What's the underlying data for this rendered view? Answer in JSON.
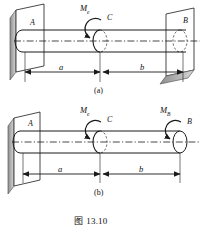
{
  "figure": {
    "caption": "图 13.10",
    "caption_prefix": "图",
    "caption_number": "13.10"
  },
  "panels": [
    {
      "id": "a",
      "sub_caption": "(a)",
      "support_left": "fixed-wall",
      "support_right": "fixed-wall",
      "points": [
        {
          "name": "point-label-a",
          "text": "A"
        },
        {
          "name": "point-label-c",
          "text": "C"
        },
        {
          "name": "point-label-b",
          "text": "B"
        }
      ],
      "moments": [
        {
          "name": "moment-me",
          "symbol": "M",
          "subscript": "e",
          "at": "C"
        }
      ],
      "dimensions": [
        {
          "name": "dimension-a",
          "text": "a",
          "from": "A",
          "to": "C"
        },
        {
          "name": "dimension-b",
          "text": "b",
          "from": "C",
          "to": "B"
        }
      ]
    },
    {
      "id": "b",
      "sub_caption": "(b)",
      "support_left": "fixed-wall",
      "support_right": "free-end",
      "points": [
        {
          "name": "point-label-a",
          "text": "A"
        },
        {
          "name": "point-label-c",
          "text": "C"
        },
        {
          "name": "point-label-b",
          "text": "B"
        }
      ],
      "moments": [
        {
          "name": "moment-me",
          "symbol": "M",
          "subscript": "e",
          "at": "C"
        },
        {
          "name": "moment-mb",
          "symbol": "M",
          "subscript": "B",
          "at": "B"
        }
      ],
      "dimensions": [
        {
          "name": "dimension-a",
          "text": "a",
          "from": "A",
          "to": "C"
        },
        {
          "name": "dimension-b",
          "text": "b",
          "from": "C",
          "to": "B"
        }
      ]
    }
  ],
  "colors": {
    "line": "#1a1a1a",
    "wall_face": "#ffffff",
    "wall_edge": "#9a9a9a",
    "background": "#ffffff"
  }
}
